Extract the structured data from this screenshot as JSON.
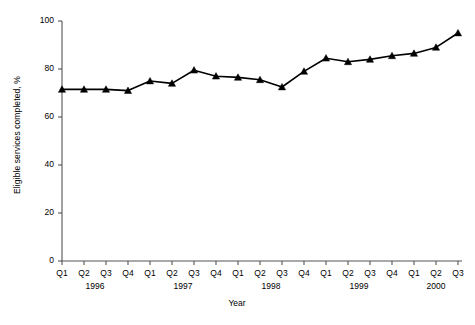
{
  "chart_data": {
    "type": "line",
    "title": "",
    "xlabel": "Year",
    "ylabel": "Eligible services completed, %",
    "ylim": [
      0,
      100
    ],
    "yticks": [
      0,
      20,
      40,
      60,
      80,
      100
    ],
    "grid": false,
    "legend": null,
    "marker": "triangle",
    "line_color": "#000000",
    "marker_color": "#000000",
    "categories": [
      "Q1",
      "Q2",
      "Q3",
      "Q4",
      "Q1",
      "Q2",
      "Q3",
      "Q4",
      "Q1",
      "Q2",
      "Q3",
      "Q4",
      "Q1",
      "Q2",
      "Q3",
      "Q4",
      "Q1",
      "Q2",
      "Q3"
    ],
    "years": [
      {
        "label": "1996",
        "start_index": 0,
        "end_index": 3
      },
      {
        "label": "1997",
        "start_index": 4,
        "end_index": 7
      },
      {
        "label": "1998",
        "start_index": 8,
        "end_index": 11
      },
      {
        "label": "1999",
        "start_index": 12,
        "end_index": 15
      },
      {
        "label": "2000",
        "start_index": 16,
        "end_index": 18
      }
    ],
    "x_tick_labels": [
      "Q1 1996",
      "Q2 1996",
      "Q3 1996",
      "Q4 1996",
      "Q1 1997",
      "Q2 1997",
      "Q3 1997",
      "Q4 1997",
      "Q1 1998",
      "Q2 1998",
      "Q3 1998",
      "Q4 1998",
      "Q1 1999",
      "Q2 1999",
      "Q3 1999",
      "Q4 1999",
      "Q1 2000",
      "Q2 2000",
      "Q3 2000"
    ],
    "values": [
      71.5,
      71.5,
      71.5,
      71.0,
      75.0,
      74.0,
      79.5,
      77.0,
      76.5,
      75.5,
      72.5,
      79.0,
      84.5,
      83.0,
      84.0,
      85.5,
      86.5,
      89.0,
      95.0
    ]
  }
}
